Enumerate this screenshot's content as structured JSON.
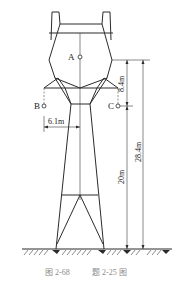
{
  "figure": {
    "caption_figure": "图 2-68",
    "caption_problem": "题 2-25 图"
  },
  "points": {
    "A": "A",
    "B": "B",
    "C": "C"
  },
  "dimensions": {
    "d1": "8.4m",
    "d2": "28.4m",
    "d3": "20m",
    "d4": "6.1m"
  },
  "colors": {
    "line": "#2b2b2b",
    "caption": "#8a8a8a"
  }
}
